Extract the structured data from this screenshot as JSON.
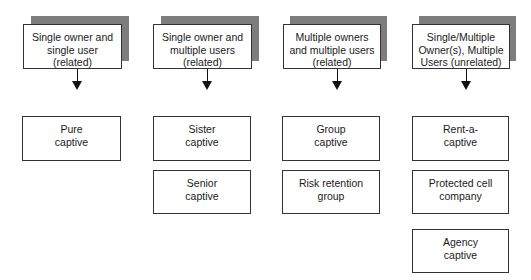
{
  "diagram": {
    "columns": [
      {
        "header": "Single owner and\nsingle user\n(related)",
        "children": [
          "Pure\ncaptive"
        ]
      },
      {
        "header": "Single owner  and\nmultiple users\n(related)",
        "children": [
          "Sister\ncaptive",
          "Senior\ncaptive"
        ]
      },
      {
        "header": "Multiple owners\nand multiple users\n(related)",
        "children": [
          "Group\ncaptive",
          "Risk retention\ngroup"
        ]
      },
      {
        "header": "Single/Multiple\nOwner(s), Multiple\nUsers (unrelated)",
        "children": [
          "Rent-a-\ncaptive",
          "Protected cell\ncompany",
          "Agency\ncaptive"
        ]
      }
    ],
    "colors": {
      "shadow": "#7d7d7d",
      "border": "#333333",
      "arrow": "#111111"
    }
  }
}
